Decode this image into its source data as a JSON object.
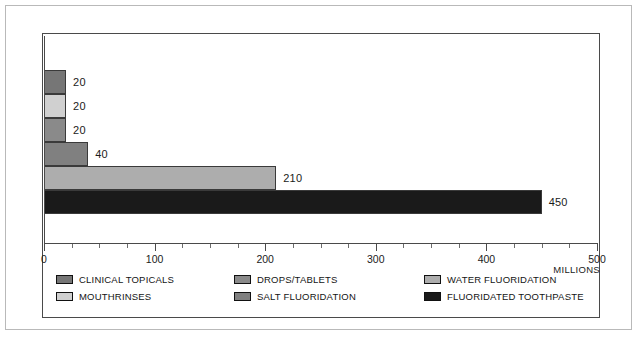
{
  "chart_data": {
    "type": "bar",
    "orientation": "horizontal",
    "title": "",
    "xlabel": "MILLIONS",
    "ylabel": "",
    "xlim": [
      0,
      500
    ],
    "grid": false,
    "legend_position": "bottom",
    "categories": [
      "CLINICAL TOPICALS",
      "MOUTHRINSES",
      "DROPS/TABLETS",
      "SALT FLUORIDATION",
      "WATER FLUORIDATION",
      "FLUORIDATED TOOTHPASTE"
    ],
    "values": [
      20,
      20,
      20,
      40,
      210,
      450
    ],
    "value_labels": [
      "20",
      "20",
      "20",
      "40",
      "210",
      "450"
    ],
    "colors": [
      "#767676",
      "#d0d0d0",
      "#8a8a8a",
      "#808080",
      "#adadad",
      "#1a1a1a"
    ],
    "x_ticks": [
      0,
      100,
      200,
      300,
      400,
      500
    ],
    "x_tick_labels": [
      "0",
      "100",
      "200",
      "300",
      "400",
      "500"
    ],
    "x_minor_ticks": [
      25,
      50,
      75,
      125,
      150,
      175,
      225,
      250,
      275,
      325,
      350,
      375,
      425,
      450,
      475
    ],
    "bars": [
      {
        "label": "CLINICAL TOPICALS",
        "value": 20,
        "value_label": "20",
        "color": "#767676"
      },
      {
        "label": "MOUTHRINSES",
        "value": 20,
        "value_label": "20",
        "color": "#d0d0d0"
      },
      {
        "label": "DROPS/TABLETS",
        "value": 20,
        "value_label": "20",
        "color": "#8a8a8a"
      },
      {
        "label": "SALT FLUORIDATION",
        "value": 40,
        "value_label": "40",
        "color": "#808080"
      },
      {
        "label": "WATER FLUORIDATION",
        "value": 210,
        "value_label": "210",
        "color": "#adadad"
      },
      {
        "label": "FLUORIDATED TOOTHPASTE",
        "value": 450,
        "value_label": "450",
        "color": "#1a1a1a"
      }
    ],
    "legend": [
      {
        "label": "CLINICAL TOPICALS",
        "color": "#767676",
        "column": 0,
        "row": 0
      },
      {
        "label": "MOUTHRINSES",
        "color": "#d0d0d0",
        "column": 0,
        "row": 1
      },
      {
        "label": "DROPS/TABLETS",
        "color": "#8a8a8a",
        "column": 1,
        "row": 0
      },
      {
        "label": "SALT FLUORIDATION",
        "color": "#808080",
        "column": 1,
        "row": 1
      },
      {
        "label": "WATER FLUORIDATION",
        "color": "#adadad",
        "column": 2,
        "row": 0
      },
      {
        "label": "FLUORIDATED TOOTHPASTE",
        "color": "#1a1a1a",
        "column": 2,
        "row": 1
      }
    ]
  },
  "axis": {
    "units_label": "MILLIONS"
  },
  "style": {
    "frame_color": "#4a4a4a",
    "outer_border_color": "#b9b9b9",
    "background": "#ffffff",
    "text_color": "#1b1b1b"
  }
}
